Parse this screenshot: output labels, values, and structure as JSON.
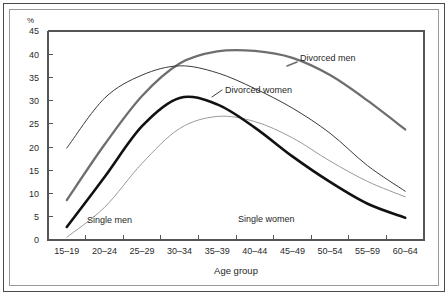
{
  "chart_data": {
    "type": "line",
    "title": "",
    "xlabel": "Age group",
    "ylabel": "%",
    "ylim": [
      0,
      45
    ],
    "yticks": [
      "0",
      "5",
      "10",
      "15",
      "20",
      "25",
      "30",
      "35",
      "40",
      "45"
    ],
    "grid": false,
    "legend_position": "inline-annotations",
    "categories": [
      "15–19",
      "20–24",
      "25–29",
      "30–34",
      "35–39",
      "40–44",
      "45–49",
      "50–54",
      "55–59",
      "60–64"
    ],
    "series": [
      {
        "name": "Divorced men",
        "label": "Divorced men",
        "color": "#6e6e6e",
        "width": 2.3,
        "values": [
          8.6,
          20.5,
          31.0,
          38.0,
          40.6,
          40.7,
          39.2,
          35.5,
          30.0,
          23.8
        ]
      },
      {
        "name": "Divorced women",
        "label": "Divorced women",
        "color": "#3a3a3a",
        "width": 1.0,
        "values": [
          19.8,
          30.5,
          35.5,
          37.5,
          36.0,
          32.6,
          28.4,
          23.0,
          16.0,
          10.5
        ]
      },
      {
        "name": "Single men",
        "label": "Single men",
        "color": "#9a9a9a",
        "width": 1.0,
        "values": [
          0.6,
          7.0,
          16.5,
          24.0,
          26.6,
          25.5,
          22.0,
          17.0,
          12.6,
          9.3
        ]
      },
      {
        "name": "Single women",
        "label": "Single women",
        "color": "#111111",
        "width": 2.6,
        "values": [
          2.8,
          13.5,
          24.5,
          30.6,
          29.2,
          24.2,
          18.0,
          12.5,
          7.8,
          4.8
        ]
      }
    ],
    "annotations": [
      {
        "text": "Divorced men",
        "x": 300,
        "y": 61
      },
      {
        "text": "Divorced women",
        "x": 225,
        "y": 93
      },
      {
        "text": "Single men",
        "x": 87,
        "y": 223
      },
      {
        "text": "Single women",
        "x": 238,
        "y": 222
      }
    ]
  }
}
